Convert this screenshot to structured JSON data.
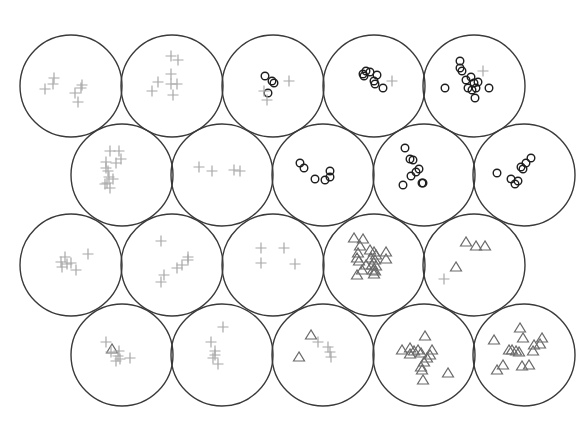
{
  "diagram": {
    "type": "hexagonal-cell-map",
    "cell_radius": 51,
    "marker_styles": {
      "plus": {
        "color": "#a8a8a8",
        "icon": "plus-marker"
      },
      "circle": {
        "color": "#1e1e1e",
        "icon": "circle-marker"
      },
      "triangle": {
        "color": "#6a6a6a",
        "icon": "triangle-marker"
      }
    },
    "cells": [
      {
        "row": 0,
        "col": 0,
        "cx": 71,
        "cy": 86,
        "markers": [
          {
            "t": "plus",
            "x": -17,
            "y": -8
          },
          {
            "t": "plus",
            "x": -18,
            "y": -2
          },
          {
            "t": "plus",
            "x": -26,
            "y": 3
          },
          {
            "t": "plus",
            "x": 4,
            "y": 7
          },
          {
            "t": "plus",
            "x": 10,
            "y": 2
          },
          {
            "t": "plus",
            "x": 11,
            "y": -1
          },
          {
            "t": "plus",
            "x": 7,
            "y": 16
          }
        ]
      },
      {
        "row": 0,
        "col": 1,
        "cx": 172,
        "cy": 86,
        "markers": [
          {
            "t": "plus",
            "x": -1,
            "y": -30
          },
          {
            "t": "plus",
            "x": 6,
            "y": -26
          },
          {
            "t": "plus",
            "x": -1,
            "y": -12
          },
          {
            "t": "plus",
            "x": -14,
            "y": -4
          },
          {
            "t": "plus",
            "x": -1,
            "y": -2
          },
          {
            "t": "plus",
            "x": 5,
            "y": -2
          },
          {
            "t": "plus",
            "x": -20,
            "y": 5
          },
          {
            "t": "plus",
            "x": 1,
            "y": 9
          }
        ]
      },
      {
        "row": 0,
        "col": 2,
        "cx": 273,
        "cy": 86,
        "markers": [
          {
            "t": "circle",
            "x": -8,
            "y": -10
          },
          {
            "t": "circle",
            "x": -1,
            "y": -5
          },
          {
            "t": "circle",
            "x": 1,
            "y": -3
          },
          {
            "t": "circle",
            "x": -5,
            "y": 7
          },
          {
            "t": "plus",
            "x": 16,
            "y": -5
          },
          {
            "t": "plus",
            "x": -9,
            "y": 5
          },
          {
            "t": "plus",
            "x": -6,
            "y": 14
          }
        ]
      },
      {
        "row": 0,
        "col": 3,
        "cx": 374,
        "cy": 86,
        "markers": [
          {
            "t": "circle",
            "x": -8,
            "y": -15
          },
          {
            "t": "circle",
            "x": -4,
            "y": -14
          },
          {
            "t": "circle",
            "x": -11,
            "y": -12
          },
          {
            "t": "circle",
            "x": -10,
            "y": -10
          },
          {
            "t": "circle",
            "x": 3,
            "y": -11
          },
          {
            "t": "circle",
            "x": 0,
            "y": -5
          },
          {
            "t": "circle",
            "x": 1,
            "y": -2
          },
          {
            "t": "circle",
            "x": 9,
            "y": 2
          },
          {
            "t": "plus",
            "x": 18,
            "y": -5
          }
        ]
      },
      {
        "row": 0,
        "col": 4,
        "cx": 474,
        "cy": 86,
        "markers": [
          {
            "t": "circle",
            "x": -14,
            "y": -25
          },
          {
            "t": "circle",
            "x": -14,
            "y": -18
          },
          {
            "t": "circle",
            "x": -12,
            "y": -15
          },
          {
            "t": "circle",
            "x": -3,
            "y": -9
          },
          {
            "t": "circle",
            "x": -8,
            "y": -6
          },
          {
            "t": "circle",
            "x": 0,
            "y": -3
          },
          {
            "t": "circle",
            "x": 4,
            "y": -4
          },
          {
            "t": "circle",
            "x": -6,
            "y": 2
          },
          {
            "t": "circle",
            "x": -2,
            "y": 4
          },
          {
            "t": "circle",
            "x": 2,
            "y": 2
          },
          {
            "t": "circle",
            "x": -29,
            "y": 2
          },
          {
            "t": "circle",
            "x": 15,
            "y": 2
          },
          {
            "t": "circle",
            "x": 1,
            "y": 12
          },
          {
            "t": "plus",
            "x": 9,
            "y": -15
          }
        ]
      },
      {
        "row": 1,
        "col": 0,
        "cx": 122,
        "cy": 175,
        "markers": [
          {
            "t": "plus",
            "x": -12,
            "y": -24
          },
          {
            "t": "plus",
            "x": -3,
            "y": -24
          },
          {
            "t": "plus",
            "x": -1,
            "y": -16
          },
          {
            "t": "plus",
            "x": -6,
            "y": -12
          },
          {
            "t": "plus",
            "x": -16,
            "y": -13
          },
          {
            "t": "plus",
            "x": -16,
            "y": -7
          },
          {
            "t": "plus",
            "x": -14,
            "y": -4
          },
          {
            "t": "plus",
            "x": -13,
            "y": 2
          },
          {
            "t": "plus",
            "x": -9,
            "y": 4
          },
          {
            "t": "plus",
            "x": -15,
            "y": 8
          },
          {
            "t": "plus",
            "x": -17,
            "y": 9
          },
          {
            "t": "plus",
            "x": -12,
            "y": 13
          }
        ]
      },
      {
        "row": 1,
        "col": 1,
        "cx": 222,
        "cy": 175,
        "markers": [
          {
            "t": "plus",
            "x": -23,
            "y": -8
          },
          {
            "t": "plus",
            "x": -10,
            "y": -4
          },
          {
            "t": "plus",
            "x": 12,
            "y": -5
          },
          {
            "t": "plus",
            "x": 18,
            "y": -4
          }
        ]
      },
      {
        "row": 1,
        "col": 2,
        "cx": 323,
        "cy": 175,
        "markers": [
          {
            "t": "circle",
            "x": -23,
            "y": -12
          },
          {
            "t": "circle",
            "x": -19,
            "y": -7
          },
          {
            "t": "circle",
            "x": -8,
            "y": 4
          },
          {
            "t": "circle",
            "x": 2,
            "y": 5
          },
          {
            "t": "circle",
            "x": 7,
            "y": 2
          },
          {
            "t": "circle",
            "x": 7,
            "y": -4
          }
        ]
      },
      {
        "row": 1,
        "col": 3,
        "cx": 424,
        "cy": 175,
        "markers": [
          {
            "t": "circle",
            "x": -19,
            "y": -27
          },
          {
            "t": "circle",
            "x": -14,
            "y": -16
          },
          {
            "t": "circle",
            "x": -11,
            "y": -15
          },
          {
            "t": "circle",
            "x": -5,
            "y": -6
          },
          {
            "t": "circle",
            "x": -8,
            "y": -3
          },
          {
            "t": "circle",
            "x": -13,
            "y": 1
          },
          {
            "t": "circle",
            "x": -21,
            "y": 10
          },
          {
            "t": "circle",
            "x": -2,
            "y": 8
          },
          {
            "t": "circle",
            "x": -1,
            "y": 8
          }
        ]
      },
      {
        "row": 1,
        "col": 4,
        "cx": 524,
        "cy": 175,
        "markers": [
          {
            "t": "circle",
            "x": -27,
            "y": -2
          },
          {
            "t": "circle",
            "x": -13,
            "y": 4
          },
          {
            "t": "circle",
            "x": -9,
            "y": 9
          },
          {
            "t": "circle",
            "x": -6,
            "y": 6
          },
          {
            "t": "circle",
            "x": -3,
            "y": -8
          },
          {
            "t": "circle",
            "x": 2,
            "y": -12
          },
          {
            "t": "circle",
            "x": 7,
            "y": -17
          },
          {
            "t": "circle",
            "x": -1,
            "y": -6
          }
        ]
      },
      {
        "row": 2,
        "col": 0,
        "cx": 71,
        "cy": 265,
        "markers": [
          {
            "t": "plus",
            "x": -6,
            "y": -8
          },
          {
            "t": "plus",
            "x": -10,
            "y": -3
          },
          {
            "t": "plus",
            "x": -4,
            "y": -1
          },
          {
            "t": "plus",
            "x": -9,
            "y": 2
          },
          {
            "t": "plus",
            "x": 0,
            "y": -2
          },
          {
            "t": "plus",
            "x": 5,
            "y": 5
          },
          {
            "t": "plus",
            "x": 17,
            "y": -11
          }
        ]
      },
      {
        "row": 2,
        "col": 1,
        "cx": 172,
        "cy": 265,
        "markers": [
          {
            "t": "plus",
            "x": -11,
            "y": -24
          },
          {
            "t": "plus",
            "x": 16,
            "y": -8
          },
          {
            "t": "plus",
            "x": 16,
            "y": -5
          },
          {
            "t": "plus",
            "x": 10,
            "y": 0
          },
          {
            "t": "plus",
            "x": 5,
            "y": 3
          },
          {
            "t": "plus",
            "x": -8,
            "y": 10
          },
          {
            "t": "plus",
            "x": -11,
            "y": 17
          }
        ]
      },
      {
        "row": 2,
        "col": 2,
        "cx": 273,
        "cy": 265,
        "markers": [
          {
            "t": "plus",
            "x": -12,
            "y": -17
          },
          {
            "t": "plus",
            "x": 11,
            "y": -17
          },
          {
            "t": "plus",
            "x": -12,
            "y": -2
          },
          {
            "t": "plus",
            "x": 22,
            "y": -1
          }
        ]
      },
      {
        "row": 2,
        "col": 3,
        "cx": 374,
        "cy": 265,
        "markers": [
          {
            "t": "tri",
            "x": -20,
            "y": -27
          },
          {
            "t": "tri",
            "x": -11,
            "y": -26
          },
          {
            "t": "tri",
            "x": -14,
            "y": -19
          },
          {
            "t": "tri",
            "x": -16,
            "y": -12
          },
          {
            "t": "tri",
            "x": -4,
            "y": -15
          },
          {
            "t": "tri",
            "x": 0,
            "y": -13
          },
          {
            "t": "tri",
            "x": 2,
            "y": -10
          },
          {
            "t": "tri",
            "x": -17,
            "y": -7
          },
          {
            "t": "tri",
            "x": -15,
            "y": -4
          },
          {
            "t": "tri",
            "x": -3,
            "y": -7
          },
          {
            "t": "tri",
            "x": 1,
            "y": -5
          },
          {
            "t": "tri",
            "x": 12,
            "y": -13
          },
          {
            "t": "tri",
            "x": 12,
            "y": -6
          },
          {
            "t": "tri",
            "x": -8,
            "y": 0
          },
          {
            "t": "tri",
            "x": -2,
            "y": 0
          },
          {
            "t": "tri",
            "x": 2,
            "y": 1
          },
          {
            "t": "tri",
            "x": -12,
            "y": 5
          },
          {
            "t": "tri",
            "x": -1,
            "y": 5
          },
          {
            "t": "tri",
            "x": 1,
            "y": 6
          },
          {
            "t": "tri",
            "x": -17,
            "y": 10
          },
          {
            "t": "tri",
            "x": 0,
            "y": 9
          }
        ]
      },
      {
        "row": 2,
        "col": 4,
        "cx": 474,
        "cy": 265,
        "markers": [
          {
            "t": "tri",
            "x": -8,
            "y": -23
          },
          {
            "t": "tri",
            "x": 2,
            "y": -19
          },
          {
            "t": "tri",
            "x": 11,
            "y": -19
          },
          {
            "t": "tri",
            "x": -18,
            "y": 2
          },
          {
            "t": "plus",
            "x": -30,
            "y": 14
          }
        ]
      },
      {
        "row": 3,
        "col": 0,
        "cx": 122,
        "cy": 355,
        "markers": [
          {
            "t": "plus",
            "x": -16,
            "y": -13
          },
          {
            "t": "tri",
            "x": -10,
            "y": -6
          },
          {
            "t": "plus",
            "x": -11,
            "y": -3
          },
          {
            "t": "plus",
            "x": -3,
            "y": -4
          },
          {
            "t": "plus",
            "x": -4,
            "y": 1
          },
          {
            "t": "plus",
            "x": -2,
            "y": 4
          },
          {
            "t": "plus",
            "x": 8,
            "y": 3
          },
          {
            "t": "plus",
            "x": -6,
            "y": 6
          }
        ]
      },
      {
        "row": 3,
        "col": 1,
        "cx": 222,
        "cy": 355,
        "markers": [
          {
            "t": "plus",
            "x": 1,
            "y": -28
          },
          {
            "t": "plus",
            "x": -11,
            "y": -13
          },
          {
            "t": "plus",
            "x": -7,
            "y": -4
          },
          {
            "t": "plus",
            "x": -7,
            "y": 0
          },
          {
            "t": "plus",
            "x": -9,
            "y": 3
          },
          {
            "t": "plus",
            "x": -4,
            "y": 9
          }
        ]
      },
      {
        "row": 3,
        "col": 2,
        "cx": 323,
        "cy": 355,
        "markers": [
          {
            "t": "tri",
            "x": -12,
            "y": -20
          },
          {
            "t": "plus",
            "x": -5,
            "y": -13
          },
          {
            "t": "plus",
            "x": 5,
            "y": -8
          },
          {
            "t": "plus",
            "x": 7,
            "y": -3
          },
          {
            "t": "plus",
            "x": 8,
            "y": 2
          },
          {
            "t": "tri",
            "x": -24,
            "y": 2
          }
        ]
      },
      {
        "row": 3,
        "col": 3,
        "cx": 424,
        "cy": 355,
        "markers": [
          {
            "t": "tri",
            "x": 1,
            "y": -19
          },
          {
            "t": "tri",
            "x": -22,
            "y": -5
          },
          {
            "t": "tri",
            "x": -14,
            "y": -7
          },
          {
            "t": "tri",
            "x": -10,
            "y": -4
          },
          {
            "t": "tri",
            "x": -6,
            "y": -5
          },
          {
            "t": "tri",
            "x": -3,
            "y": -2
          },
          {
            "t": "tri",
            "x": 8,
            "y": -5
          },
          {
            "t": "tri",
            "x": 6,
            "y": 0
          },
          {
            "t": "tri",
            "x": 3,
            "y": 3
          },
          {
            "t": "tri",
            "x": 0,
            "y": 7
          },
          {
            "t": "tri",
            "x": -3,
            "y": 12
          },
          {
            "t": "tri",
            "x": -2,
            "y": 15
          },
          {
            "t": "tri",
            "x": 24,
            "y": 18
          },
          {
            "t": "tri",
            "x": -1,
            "y": 25
          },
          {
            "t": "tri",
            "x": -14,
            "y": -1
          }
        ]
      },
      {
        "row": 3,
        "col": 4,
        "cx": 524,
        "cy": 355,
        "markers": [
          {
            "t": "tri",
            "x": -4,
            "y": -27
          },
          {
            "t": "tri",
            "x": -1,
            "y": -17
          },
          {
            "t": "tri",
            "x": 18,
            "y": -17
          },
          {
            "t": "tri",
            "x": -30,
            "y": -15
          },
          {
            "t": "tri",
            "x": 10,
            "y": -10
          },
          {
            "t": "tri",
            "x": 16,
            "y": -11
          },
          {
            "t": "tri",
            "x": -15,
            "y": -5
          },
          {
            "t": "tri",
            "x": -12,
            "y": -5
          },
          {
            "t": "tri",
            "x": -8,
            "y": -4
          },
          {
            "t": "tri",
            "x": -5,
            "y": -3
          },
          {
            "t": "tri",
            "x": 9,
            "y": -4
          },
          {
            "t": "tri",
            "x": -21,
            "y": 10
          },
          {
            "t": "tri",
            "x": -27,
            "y": 15
          },
          {
            "t": "tri",
            "x": -2,
            "y": 11
          },
          {
            "t": "tri",
            "x": 5,
            "y": 10
          }
        ]
      }
    ]
  }
}
